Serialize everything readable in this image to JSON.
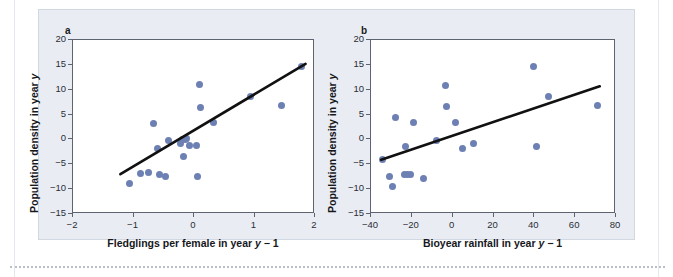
{
  "figure": {
    "background_color": "#e9edf3",
    "marker_color": "#6d80b3",
    "line_color": "#111111"
  },
  "panels": {
    "a": {
      "letter": "a",
      "xlabel": "Fledglings per female in year y − 1",
      "ylabel": "Population density in year y",
      "xticks": [
        "−2",
        "−1",
        "0",
        "1",
        "2"
      ],
      "yticks": [
        "20",
        "15",
        "10",
        "5",
        "0",
        "−5",
        "−10",
        "−15"
      ]
    },
    "b": {
      "letter": "b",
      "xlabel": "Bioyear rainfall in year y − 1",
      "ylabel": "Population density in year y",
      "xticks": [
        "−40",
        "−20",
        "0",
        "20",
        "40",
        "60",
        "80"
      ],
      "yticks": [
        "20",
        "15",
        "10",
        "5",
        "0",
        "−5",
        "−10",
        "−15"
      ]
    }
  },
  "chart_data": [
    {
      "type": "scatter",
      "panel": "a",
      "title": "",
      "xlabel": "Fledglings per female in year y − 1",
      "ylabel": "Population density in year y",
      "xlim": [
        -2,
        2
      ],
      "ylim": [
        -15,
        20
      ],
      "xticks": [
        -2,
        -1,
        0,
        1,
        2
      ],
      "yticks": [
        -15,
        -10,
        -5,
        0,
        5,
        10,
        15,
        20
      ],
      "grid": false,
      "legend": "none",
      "points": [
        {
          "x": -1.05,
          "y": -9.1
        },
        {
          "x": -0.87,
          "y": -7.0
        },
        {
          "x": -0.73,
          "y": -6.8
        },
        {
          "x": -0.66,
          "y": 3.1
        },
        {
          "x": -0.59,
          "y": -2.0
        },
        {
          "x": -0.56,
          "y": -7.2
        },
        {
          "x": -0.45,
          "y": -7.7
        },
        {
          "x": -0.41,
          "y": -0.4
        },
        {
          "x": -0.21,
          "y": -1.1
        },
        {
          "x": -0.17,
          "y": -0.3
        },
        {
          "x": -0.15,
          "y": -3.7
        },
        {
          "x": -0.13,
          "y": -0.2
        },
        {
          "x": -0.1,
          "y": 0.0
        },
        {
          "x": -0.06,
          "y": -1.5
        },
        {
          "x": 0.05,
          "y": -1.4
        },
        {
          "x": 0.07,
          "y": -7.7
        },
        {
          "x": 0.1,
          "y": 10.8
        },
        {
          "x": 0.12,
          "y": 6.3
        },
        {
          "x": 0.34,
          "y": 3.2
        },
        {
          "x": 0.95,
          "y": 8.5
        },
        {
          "x": 1.46,
          "y": 6.7
        },
        {
          "x": 1.8,
          "y": 14.5
        }
      ],
      "fit_line": {
        "x0": -1.2,
        "y0": -7.2,
        "x1": 1.86,
        "y1": 15.0
      }
    },
    {
      "type": "scatter",
      "panel": "b",
      "title": "",
      "xlabel": "Bioyear rainfall in year y − 1",
      "ylabel": "Population density in year y",
      "xlim": [
        -40,
        80
      ],
      "ylim": [
        -15,
        20
      ],
      "xticks": [
        -40,
        -20,
        0,
        20,
        40,
        60,
        80
      ],
      "yticks": [
        -15,
        -10,
        -5,
        0,
        5,
        10,
        15,
        20
      ],
      "grid": false,
      "legend": "none",
      "points": [
        {
          "x": -34.0,
          "y": -4.2
        },
        {
          "x": -30.5,
          "y": -7.6
        },
        {
          "x": -29.0,
          "y": -9.6
        },
        {
          "x": -27.5,
          "y": 4.3
        },
        {
          "x": -23.0,
          "y": -7.2
        },
        {
          "x": -22.5,
          "y": -1.7
        },
        {
          "x": -21.5,
          "y": -7.2
        },
        {
          "x": -20.0,
          "y": -7.2
        },
        {
          "x": -18.5,
          "y": 3.2
        },
        {
          "x": -14.0,
          "y": -8.1
        },
        {
          "x": -7.5,
          "y": -0.4
        },
        {
          "x": -3.0,
          "y": 10.7
        },
        {
          "x": -2.5,
          "y": 6.5
        },
        {
          "x": 2.0,
          "y": 3.2
        },
        {
          "x": 5.5,
          "y": -2.1
        },
        {
          "x": 10.5,
          "y": -1.0
        },
        {
          "x": 40.0,
          "y": 14.4
        },
        {
          "x": 41.5,
          "y": -1.7
        },
        {
          "x": 47.5,
          "y": 8.5
        },
        {
          "x": 71.5,
          "y": 6.7
        }
      ],
      "fit_line": {
        "x0": -34.5,
        "y0": -4.3,
        "x1": 72.5,
        "y1": 10.5
      }
    }
  ]
}
